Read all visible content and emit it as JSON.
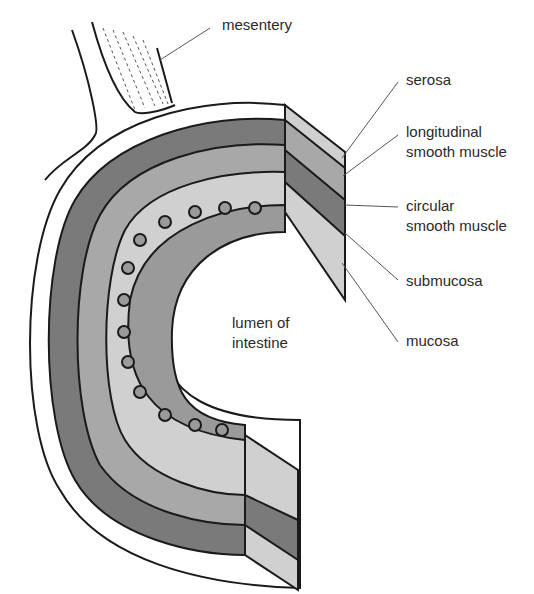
{
  "diagram": {
    "labels": {
      "mesentery": "mesentery",
      "serosa": "serosa",
      "longitudinal_1": "longitudinal",
      "longitudinal_2": "smooth muscle",
      "circular_1": "circular",
      "circular_2": "smooth muscle",
      "submucosa": "submucosa",
      "mucosa": "mucosa",
      "lumen_1": "lumen of",
      "lumen_2": "intestine"
    },
    "colors": {
      "serosa": "#ffffff",
      "outer_muscle": "#7a7a7a",
      "dashed_muscle": "#a8a8a8",
      "submucosa": "#d0d0d0",
      "mucosa": "#9a9a9a",
      "outline": "#1a1a1a"
    }
  }
}
